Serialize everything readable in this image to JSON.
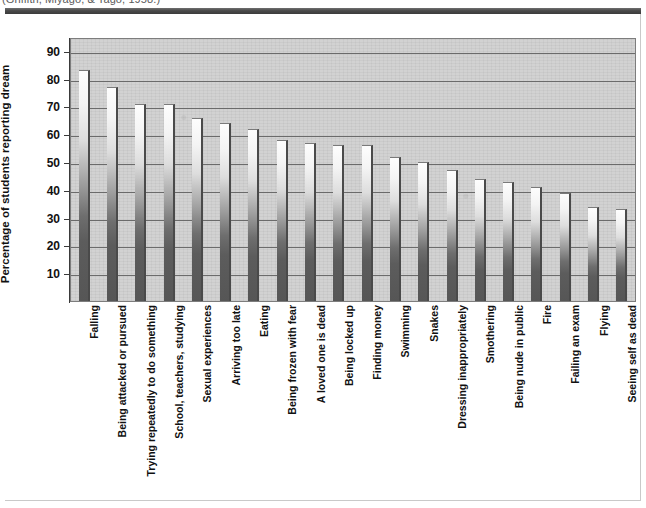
{
  "citation": "(Griffith, Miyago, & Tago, 1958.)",
  "chart_data": {
    "type": "bar",
    "title": "",
    "xlabel": "",
    "ylabel": "Percentage of students reporting dream",
    "ylim": [
      0,
      95
    ],
    "ytick_values": [
      10,
      20,
      30,
      40,
      50,
      60,
      70,
      80,
      90
    ],
    "ytick_labels": [
      "10",
      "20",
      "30",
      "40",
      "50",
      "60",
      "70",
      "80",
      "90"
    ],
    "grid": true,
    "legend": "none",
    "categories": [
      "Falling",
      "Being attacked or pursued",
      "Trying repeatedly to do something",
      "School, teachers, studying",
      "Sexual experiences",
      "Arriving too late",
      "Eating",
      "Being frozen with fear",
      "A loved one is dead",
      "Being locked up",
      "Finding money",
      "Swimming",
      "Snakes",
      "Dressing inappropriately",
      "Smothering",
      "Being nude in public",
      "Fire",
      "Failing an exam",
      "Flying",
      "Seeing self as dead"
    ],
    "values": [
      83,
      77,
      71,
      71,
      66,
      64,
      62,
      58,
      57,
      56,
      56,
      52,
      50,
      47,
      44,
      43,
      41,
      39,
      34,
      33
    ]
  },
  "colors": {
    "bar_top": "#fdfdfd",
    "bar_bottom": "#565656",
    "plot_background": "#d2d2d2",
    "gridline": "#6b6b6b",
    "axis": "#3a3a3a",
    "header_rule": "#4a4a4a",
    "text": "#111111"
  }
}
